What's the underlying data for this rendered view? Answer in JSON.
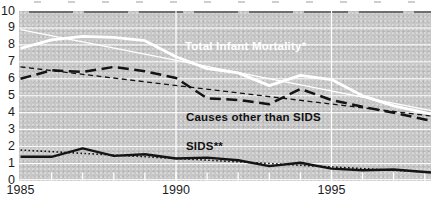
{
  "colors": {
    "plot_bg": "#c7c7c7",
    "grid": "#ffffff",
    "line_dark": "#141414",
    "line_light": "#ffffff",
    "axis_text": "#1c1c1c"
  },
  "chart_data": {
    "type": "line",
    "x": [
      1985,
      1986,
      1987,
      1988,
      1989,
      1990,
      1991,
      1992,
      1993,
      1994,
      1995,
      1996,
      1997,
      1998
    ],
    "series": [
      {
        "name": "Total Infant Mortality*",
        "color": "#ffffff",
        "style": "solid",
        "width": 2.8,
        "values": [
          7.8,
          8.3,
          8.5,
          8.45,
          8.25,
          7.3,
          6.6,
          6.35,
          5.6,
          6.2,
          5.95,
          5.0,
          4.4,
          4.0
        ]
      },
      {
        "name": "Causes other than SIDS",
        "color": "#141414",
        "style": "long-dash",
        "width": 2.5,
        "values": [
          6.0,
          6.5,
          6.4,
          6.7,
          6.45,
          6.05,
          4.85,
          4.75,
          4.5,
          5.4,
          4.75,
          4.35,
          4.0,
          3.6
        ]
      },
      {
        "name": "SIDS**",
        "color": "#141414",
        "style": "solid",
        "width": 2.4,
        "values": [
          1.4,
          1.4,
          1.9,
          1.45,
          1.55,
          1.3,
          1.35,
          1.2,
          0.85,
          1.05,
          0.7,
          0.6,
          0.65,
          0.5
        ]
      }
    ],
    "trend_lines": [
      {
        "for": "Total Infant Mortality*",
        "color": "#ffffff",
        "style": "solid",
        "width": 1.2,
        "start": 8.9,
        "end": 4.2
      },
      {
        "for": "Causes other than SIDS",
        "color": "#141414",
        "style": "short-dash",
        "width": 1.3,
        "start": 6.7,
        "end": 3.85
      },
      {
        "for": "SIDS**",
        "color": "#141414",
        "style": "dotted",
        "width": 1.6,
        "start": 1.8,
        "end": 0.5
      }
    ],
    "ylim": [
      0,
      10
    ],
    "y_ticks": [
      0,
      1,
      2,
      3,
      4,
      5,
      6,
      7,
      8,
      9,
      10
    ],
    "x_tick_labels": [
      {
        "year": 1985,
        "label": "1985"
      },
      {
        "year": 1990,
        "label": "1990"
      },
      {
        "year": 1995,
        "label": "1995"
      }
    ],
    "year_ticks": [
      1986,
      1987,
      1988,
      1989,
      1990,
      1991,
      1992,
      1993,
      1994,
      1995,
      1996,
      1997,
      1998
    ],
    "grid": "white gridlines on gray plot, vertical lines at 1990 and 1995",
    "legend": "inline annotations on chart"
  }
}
